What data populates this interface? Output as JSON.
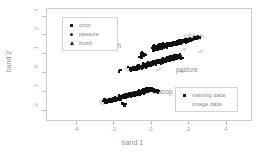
{
  "chart_data": {
    "type": "scatter",
    "title": "",
    "xlabel": "band 1",
    "ylabel": "band 2",
    "xlim": [
      -5.6,
      5.4
    ],
    "ylim": [
      -2.6,
      3.4
    ],
    "xticks": [
      -4,
      -2,
      0,
      2,
      4
    ],
    "xticklabels": [
      "-4",
      "-2",
      "0",
      "2",
      "4"
    ],
    "yticks": [
      3,
      2,
      1,
      0,
      -1,
      -2
    ],
    "yticklabels": [
      "3",
      "2",
      "1",
      "0",
      "-1",
      "-2"
    ],
    "grid": false,
    "annotations": [
      {
        "text": "bush",
        "x": -1.35,
        "y": 1.22
      },
      {
        "text": "pasture",
        "x": 1.45,
        "y": 0.03
      },
      {
        "text": "crop",
        "x": 0.55,
        "y": -1.1
      }
    ],
    "series": [
      {
        "name": "bush",
        "marker": "triangle",
        "color": "#101010",
        "x": [
          -0.55,
          -0.5,
          -0.62,
          -0.45,
          -0.38,
          -0.58,
          0.05,
          0.18,
          0.3,
          0.42,
          0.55,
          0.68,
          0.8,
          0.92,
          1.05,
          1.18,
          1.3,
          1.42,
          1.55,
          1.68,
          1.8,
          1.92,
          2.05,
          2.18,
          2.3,
          2.42,
          2.55,
          0.12,
          0.25,
          0.38,
          0.5,
          0.62,
          0.75,
          0.88,
          1.0,
          1.12,
          1.25,
          1.38,
          1.5,
          1.62,
          1.75,
          1.88,
          2.0,
          2.12,
          2.25,
          2.38,
          0.2,
          0.35,
          0.48,
          0.6,
          0.72,
          0.85,
          0.98,
          1.1,
          1.22,
          1.35,
          1.48,
          1.6,
          1.72,
          1.85,
          1.98,
          2.1,
          2.22,
          2.35,
          2.48
        ],
        "y": [
          1.05,
          0.95,
          0.88,
          1.02,
          0.92,
          0.82,
          1.38,
          1.42,
          1.45,
          1.48,
          1.5,
          1.52,
          1.55,
          1.58,
          1.6,
          1.62,
          1.65,
          1.68,
          1.7,
          1.72,
          1.75,
          1.78,
          1.8,
          1.82,
          1.85,
          1.88,
          1.9,
          1.22,
          1.26,
          1.3,
          1.33,
          1.36,
          1.4,
          1.43,
          1.46,
          1.5,
          1.53,
          1.56,
          1.6,
          1.63,
          1.66,
          1.7,
          1.73,
          1.76,
          1.8,
          1.83,
          1.3,
          1.34,
          1.37,
          1.4,
          1.44,
          1.47,
          1.5,
          1.54,
          1.57,
          1.6,
          1.64,
          1.67,
          1.7,
          1.74,
          1.77,
          1.8,
          1.84,
          1.87,
          1.9
        ]
      },
      {
        "name": "pasture",
        "marker": "square",
        "color": "#101010",
        "x": [
          -1.72,
          -1.2,
          -1.05,
          -0.9,
          -0.78,
          -0.65,
          -0.52,
          -0.4,
          -0.28,
          -0.15,
          -0.02,
          0.1,
          0.22,
          0.35,
          0.48,
          0.6,
          0.72,
          0.85,
          0.98,
          1.1,
          1.22,
          1.35,
          1.48,
          1.6,
          -1.1,
          -0.95,
          -0.82,
          -0.7,
          -0.58,
          -0.45,
          -0.32,
          -0.2,
          -0.08,
          0.05,
          0.18,
          0.3,
          0.42,
          0.55,
          0.68,
          0.8,
          0.92,
          1.05,
          1.18,
          1.3,
          1.42,
          -1.0,
          -0.86,
          -0.74,
          -0.6,
          -0.48,
          -0.35,
          -0.22,
          -0.1,
          0.02,
          0.15,
          0.28,
          0.4,
          0.52,
          0.65,
          0.78,
          0.9,
          1.02,
          1.15,
          1.28,
          1.4
        ],
        "y": [
          0.12,
          0.26,
          0.3,
          0.33,
          0.36,
          0.4,
          0.43,
          0.46,
          0.5,
          0.53,
          0.56,
          0.6,
          0.63,
          0.66,
          0.7,
          0.73,
          0.76,
          0.8,
          0.83,
          0.86,
          0.9,
          0.93,
          0.96,
          0.8,
          0.14,
          0.18,
          0.21,
          0.24,
          0.28,
          0.31,
          0.34,
          0.38,
          0.41,
          0.44,
          0.48,
          0.51,
          0.54,
          0.58,
          0.61,
          0.64,
          0.68,
          0.71,
          0.74,
          0.78,
          0.81,
          0.2,
          0.23,
          0.27,
          0.3,
          0.34,
          0.37,
          0.4,
          0.44,
          0.47,
          0.5,
          0.54,
          0.57,
          0.6,
          0.64,
          0.67,
          0.7,
          0.74,
          0.77,
          0.8,
          0.84
        ]
      },
      {
        "name": "crop",
        "marker": "square",
        "color": "#101010",
        "x": [
          -2.55,
          -2.42,
          -2.3,
          -2.18,
          -2.05,
          -1.92,
          -1.8,
          -1.68,
          -1.55,
          -1.42,
          -1.3,
          -1.18,
          -1.05,
          -0.92,
          -0.8,
          -0.68,
          -0.55,
          -0.42,
          -0.3,
          -0.18,
          -0.05,
          0.08,
          0.2,
          0.32,
          -2.45,
          -2.32,
          -2.2,
          -2.08,
          -1.95,
          -1.82,
          -1.7,
          -1.58,
          -1.45,
          -1.32,
          -1.2,
          -1.08,
          -0.95,
          -0.82,
          -0.7,
          -0.58,
          -0.45,
          -0.32,
          -0.2,
          -0.08,
          0.05,
          0.18,
          0.3,
          -2.35,
          -2.22,
          -2.1,
          -1.98,
          -1.85,
          -1.72,
          -1.6,
          -1.48,
          -1.35,
          -1.22,
          -1.1,
          -0.98,
          -0.85,
          -0.72,
          -0.6,
          -0.48,
          -0.35,
          -0.22,
          -0.1,
          0.02,
          0.15,
          0.28,
          -1.55,
          -1.42
        ],
        "y": [
          -1.45,
          -1.42,
          -1.4,
          -1.37,
          -1.34,
          -1.3,
          -1.27,
          -1.24,
          -1.2,
          -1.17,
          -1.14,
          -1.1,
          -1.07,
          -1.04,
          -1.0,
          -0.97,
          -0.94,
          -0.9,
          -0.87,
          -0.84,
          -0.85,
          -0.88,
          -0.92,
          -0.95,
          -1.55,
          -1.52,
          -1.5,
          -1.47,
          -1.44,
          -1.4,
          -1.37,
          -1.34,
          -1.3,
          -1.27,
          -1.24,
          -1.2,
          -1.17,
          -1.14,
          -1.1,
          -1.07,
          -1.04,
          -1.0,
          -0.97,
          -0.94,
          -0.96,
          -0.99,
          -1.02,
          -1.5,
          -1.47,
          -1.44,
          -1.41,
          -1.38,
          -1.35,
          -1.31,
          -1.28,
          -1.25,
          -1.22,
          -1.18,
          -1.15,
          -1.12,
          -1.08,
          -1.05,
          -1.02,
          -0.98,
          -0.95,
          -0.92,
          -0.9,
          -0.93,
          -0.96,
          -1.62,
          -1.72
        ]
      }
    ],
    "image_data_halo": {
      "name": "image data",
      "color": "#d9d9d9",
      "x": [
        -2.7,
        -2.6,
        -2.45,
        -2.2,
        -1.9,
        -1.6,
        -1.3,
        -1.0,
        -0.7,
        -0.4,
        -0.1,
        0.2,
        0.45,
        -2.65,
        -2.3,
        -2.0,
        -1.7,
        -1.4,
        -1.1,
        -0.8,
        -0.5,
        -0.2,
        0.1,
        0.35,
        -1.35,
        -1.15,
        -0.95,
        -0.75,
        -0.55,
        -0.35,
        -0.15,
        0.05,
        0.25,
        0.45,
        0.65,
        0.9,
        1.15,
        1.4,
        1.6,
        -1.25,
        -1.0,
        -0.75,
        -0.5,
        -0.25,
        0.0,
        0.3,
        0.6,
        0.9,
        1.2,
        1.5,
        1.7,
        0.0,
        0.3,
        0.6,
        0.9,
        1.2,
        1.5,
        1.8,
        2.1,
        2.4,
        2.6,
        0.1,
        0.5,
        0.9,
        1.3,
        1.7,
        2.1,
        2.5,
        2.65,
        1.8,
        2.0,
        2.2,
        2.4
      ],
      "y": [
        -1.5,
        -1.58,
        -1.4,
        -1.35,
        -1.28,
        -1.2,
        -1.12,
        -1.05,
        -0.98,
        -0.9,
        -0.88,
        -0.95,
        -1.02,
        -1.62,
        -1.52,
        -1.45,
        -1.38,
        -1.3,
        -1.22,
        -1.15,
        -1.08,
        -1.0,
        -1.05,
        0.18,
        0.22,
        0.28,
        0.32,
        0.38,
        0.42,
        0.48,
        0.55,
        0.6,
        0.66,
        0.72,
        0.8,
        0.86,
        0.92,
        0.78,
        0.08,
        0.15,
        0.22,
        0.3,
        0.38,
        0.46,
        0.56,
        0.66,
        0.76,
        0.86,
        0.94,
        0.82,
        1.25,
        1.32,
        1.4,
        1.48,
        1.55,
        1.62,
        1.7,
        1.78,
        1.86,
        1.9,
        1.15,
        1.25,
        1.36,
        1.46,
        1.56,
        1.66,
        1.78,
        1.84,
        1.95,
        1.98,
        2.0,
        1.96
      ]
    }
  },
  "legend_classes": {
    "name": "class-legend",
    "items": [
      {
        "label": "crop",
        "marker": "square"
      },
      {
        "label": "pasture",
        "marker": "circle"
      },
      {
        "label": "bush",
        "marker": "triangle"
      }
    ]
  },
  "legend_source": {
    "name": "source-legend",
    "items": [
      {
        "label": "training data",
        "marker": "square"
      },
      {
        "label": "image data",
        "marker": "none"
      }
    ]
  }
}
